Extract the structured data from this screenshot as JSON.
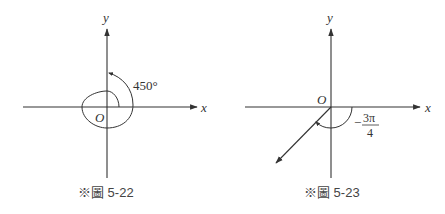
{
  "figures": [
    {
      "id": "left",
      "caption": "※圖 5-22",
      "x_label": "x",
      "y_label": "y",
      "origin_label": "O",
      "angle_label": "450°",
      "angle_value_deg": 450,
      "direction": "counterclockwise",
      "terminal_side": "positive y-axis"
    },
    {
      "id": "right",
      "caption": "※圖 5-23",
      "x_label": "x",
      "y_label": "y",
      "origin_label": "O",
      "angle_label_sign": "−",
      "angle_label_numerator": "3π",
      "angle_label_denominator": "4",
      "angle_value_rad": "-3π/4",
      "direction": "clockwise",
      "terminal_side": "third quadrant ray"
    }
  ],
  "colors": {
    "line": "#333333",
    "text": "#333333",
    "background": "#ffffff"
  }
}
